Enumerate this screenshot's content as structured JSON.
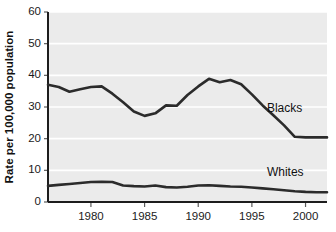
{
  "chart_data": {
    "type": "line",
    "title": "",
    "subtitle": "",
    "xlabel": "",
    "ylabel": "Rate per 100,000 population",
    "xlim": [
      1976,
      2002
    ],
    "ylim": [
      0,
      60
    ],
    "grid": true,
    "grid_axis": "y",
    "legend_position": "inline-annotation",
    "y_ticks": [
      0,
      10,
      20,
      30,
      40,
      50,
      60
    ],
    "y_tick_labels": [
      "0",
      "10",
      "20",
      "30",
      "40",
      "50",
      "60"
    ],
    "x_ticks": [
      1980,
      1985,
      1990,
      1995,
      2000
    ],
    "x_tick_labels": [
      "1980",
      "1985",
      "1990",
      "1995",
      "2000"
    ],
    "x": [
      1976,
      1977,
      1978,
      1979,
      1980,
      1981,
      1982,
      1983,
      1984,
      1985,
      1986,
      1987,
      1988,
      1989,
      1990,
      1991,
      1992,
      1993,
      1994,
      1995,
      1996,
      1997,
      1998,
      1999,
      2000,
      2001,
      2002
    ],
    "series": [
      {
        "name": "Blacks",
        "color": "#2b2b2b",
        "label": "Blacks",
        "values": [
          37.0,
          36.3,
          34.8,
          35.6,
          36.3,
          36.5,
          34.2,
          31.5,
          28.6,
          27.2,
          28.0,
          30.5,
          30.4,
          33.8,
          36.5,
          38.9,
          37.8,
          38.5,
          37.2,
          34.0,
          30.5,
          27.4,
          24.2,
          20.6,
          20.4,
          20.4,
          20.4
        ]
      },
      {
        "name": "Whites",
        "color": "#2b2b2b",
        "label": "Whites",
        "values": [
          5.1,
          5.4,
          5.7,
          6.0,
          6.3,
          6.4,
          6.3,
          5.2,
          5.0,
          4.9,
          5.2,
          4.7,
          4.6,
          4.8,
          5.2,
          5.3,
          5.1,
          4.9,
          4.8,
          4.6,
          4.3,
          4.0,
          3.7,
          3.4,
          3.2,
          3.1,
          3.1
        ]
      }
    ],
    "annotations": [
      {
        "text": "Blacks",
        "x": 1996.4,
        "y": 28.5
      },
      {
        "text": "Whites",
        "x": 1996.4,
        "y": 8.3
      }
    ]
  }
}
